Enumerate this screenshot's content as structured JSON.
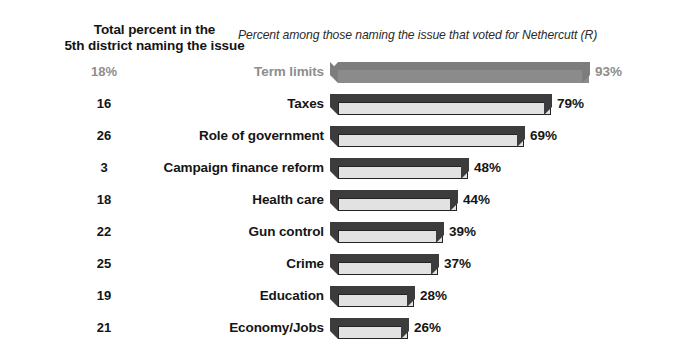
{
  "headers": {
    "left_line1": "Total percent in the",
    "left_line2": "5th district naming the issue",
    "right_title": "Percent among those naming the issue that voted for Nethercutt (R)"
  },
  "colors": {
    "background": "#ffffff",
    "bar_front": "#e2e2e2",
    "bar_shadow": "#3c3c3c",
    "text": "#151515",
    "faded_text": "#8e8e8e",
    "faded_bar": "#8b8b8b"
  },
  "chart_data": {
    "type": "bar",
    "title": "Percent among those naming the issue that voted for Nethercutt (R)",
    "subtitle": "Total percent in the 5th district naming the issue",
    "xlabel": "",
    "ylabel": "",
    "xlim": [
      0,
      100
    ],
    "grid": false,
    "legend": "none",
    "orientation": "horizontal",
    "categories": [
      "Term limits",
      "Taxes",
      "Role of government",
      "Campaign finance reform",
      "Health care",
      "Gun control",
      "Crime",
      "Education",
      "Economy/Jobs"
    ],
    "values": [
      93,
      79,
      69,
      48,
      44,
      39,
      37,
      28,
      26
    ],
    "value_labels": [
      "93%",
      "79%",
      "69%",
      "48%",
      "44%",
      "39%",
      "37%",
      "28%",
      "26%"
    ],
    "series": [
      {
        "name": "Percent among those naming the issue that voted for Nethercutt (R)",
        "values": [
          93,
          79,
          69,
          48,
          44,
          39,
          37,
          28,
          26
        ]
      },
      {
        "name": "Total percent in the 5th district naming the issue",
        "values": [
          18,
          16,
          26,
          3,
          18,
          22,
          25,
          19,
          21
        ],
        "labels": [
          "18%",
          "16",
          "26",
          "3",
          "18",
          "22",
          "25",
          "19",
          "21"
        ]
      }
    ],
    "rows": [
      {
        "category": "Term limits",
        "total": "18%",
        "value": 93,
        "value_label": "93%",
        "faded": true
      },
      {
        "category": "Taxes",
        "total": "16",
        "value": 79,
        "value_label": "79%",
        "faded": false
      },
      {
        "category": "Role of government",
        "total": "26",
        "value": 69,
        "value_label": "69%",
        "faded": false
      },
      {
        "category": "Campaign finance reform",
        "total": "3",
        "value": 48,
        "value_label": "48%",
        "faded": false
      },
      {
        "category": "Health care",
        "total": "18",
        "value": 44,
        "value_label": "44%",
        "faded": false
      },
      {
        "category": "Gun control",
        "total": "22",
        "value": 39,
        "value_label": "39%",
        "faded": false
      },
      {
        "category": "Crime",
        "total": "25",
        "value": 37,
        "value_label": "37%",
        "faded": false
      },
      {
        "category": "Education",
        "total": "19",
        "value": 28,
        "value_label": "28%",
        "faded": false
      },
      {
        "category": "Economy/Jobs",
        "total": "21",
        "value": 26,
        "value_label": "26%",
        "faded": false
      }
    ]
  }
}
